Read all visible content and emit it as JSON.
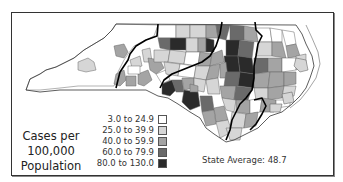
{
  "map": {
    "region": "North Carolina",
    "subject": "Cases per 100,000 Population by county"
  },
  "legend": {
    "title_lines": [
      "Cases per",
      "100,000",
      "Population"
    ],
    "items": [
      {
        "label": "3.0 to 24.9",
        "color": "#ffffff"
      },
      {
        "label": "25.0 to 39.9",
        "color": "#d6d6d6"
      },
      {
        "label": "40.0 to 59.9",
        "color": "#a4a4a4"
      },
      {
        "label": "60.0 to 79.9",
        "color": "#6a6a6a"
      },
      {
        "label": "80.0 to 130.0",
        "color": "#2a2a2a"
      }
    ]
  },
  "state_average": {
    "label": "State Average: 48.7",
    "value": 48.7
  },
  "colors": {
    "frame": "#333333",
    "county_border": "#555555",
    "region_border": "#000000"
  }
}
